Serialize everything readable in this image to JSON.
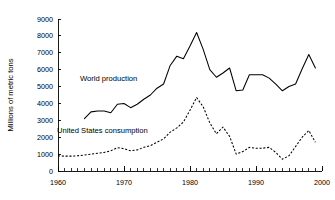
{
  "chart_data": {
    "type": "line",
    "title": "",
    "xlabel": "",
    "ylabel": "Millions of metric tons",
    "xlim": [
      1960,
      2000
    ],
    "ylim": [
      0,
      9000
    ],
    "grid": false,
    "legend_position": "inline-annotation",
    "x_ticks_major": [
      1960,
      1970,
      1980,
      1990,
      2000
    ],
    "x_tick_labels": [
      "1960",
      "1970",
      "1980",
      "1990",
      "2000"
    ],
    "x_tick_minor_step": 1,
    "y_ticks": [
      0,
      1000,
      2000,
      3000,
      4000,
      5000,
      6000,
      7000,
      8000,
      9000
    ],
    "y_tick_labels": [
      "0",
      "1000",
      "2000",
      "3000",
      "4000",
      "5000",
      "6000",
      "7000",
      "8000",
      "9000"
    ],
    "series": [
      {
        "name": "World production",
        "style": "solid",
        "color": "#000000",
        "label_text": "World production",
        "x": [
          1964,
          1965,
          1966,
          1967,
          1968,
          1969,
          1970,
          1971,
          1972,
          1973,
          1974,
          1975,
          1976,
          1977,
          1978,
          1979,
          1980,
          1981,
          1982,
          1983,
          1984,
          1985,
          1986,
          1987,
          1988,
          1989,
          1990,
          1991,
          1992,
          1993,
          1994,
          1995,
          1996,
          1997,
          1998,
          1999
        ],
        "values": [
          3100,
          3500,
          3550,
          3550,
          3450,
          3950,
          4000,
          3750,
          3950,
          4250,
          4500,
          4900,
          5150,
          6250,
          6800,
          6650,
          7400,
          8200,
          7200,
          6000,
          5550,
          5800,
          6100,
          4750,
          4800,
          5700,
          5700,
          5700,
          5500,
          5150,
          4750,
          5000,
          5150,
          6050,
          6900,
          6100
        ]
      },
      {
        "name": "United States consumption",
        "style": "dashed",
        "color": "#000000",
        "label_text": "United States consumption",
        "x": [
          1960,
          1961,
          1962,
          1963,
          1964,
          1965,
          1966,
          1967,
          1968,
          1969,
          1970,
          1971,
          1972,
          1973,
          1974,
          1975,
          1976,
          1977,
          1978,
          1979,
          1980,
          1981,
          1982,
          1983,
          1984,
          1985,
          1986,
          1987,
          1988,
          1989,
          1990,
          1991,
          1992,
          1993,
          1994,
          1995,
          1996,
          1997,
          1998,
          1999
        ],
        "values": [
          900,
          880,
          880,
          900,
          950,
          1000,
          1050,
          1100,
          1200,
          1380,
          1320,
          1200,
          1250,
          1400,
          1500,
          1700,
          1900,
          2300,
          2550,
          2900,
          3600,
          4350,
          3800,
          2850,
          2200,
          2600,
          2050,
          1000,
          1150,
          1400,
          1350,
          1350,
          1400,
          1100,
          700,
          900,
          1450,
          2000,
          2400,
          1700
        ]
      }
    ]
  },
  "annotations": {
    "world_production_label": "World production",
    "us_consumption_label": "United States consumption"
  }
}
